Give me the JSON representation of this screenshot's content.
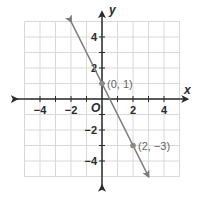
{
  "chart_data": {
    "type": "line",
    "title": "",
    "xlabel": "x",
    "ylabel": "y",
    "origin_label": "O",
    "xlim": [
      -5,
      5
    ],
    "ylim": [
      -5,
      5
    ],
    "grid": true,
    "x_tick_labels": [
      "−4",
      "−2",
      "2",
      "4"
    ],
    "x_tick_values": [
      -4,
      -2,
      2,
      4
    ],
    "y_tick_labels": [
      "4",
      "2",
      "−2",
      "−4"
    ],
    "y_tick_values": [
      4,
      2,
      -2,
      -4
    ],
    "series": [
      {
        "name": "line",
        "equation": "y = -2x + 1",
        "x": [
          -2,
          3
        ],
        "y": [
          5,
          -5
        ],
        "arrows": "both"
      }
    ],
    "points": [
      {
        "x": 0,
        "y": 1,
        "label": "(0, 1)"
      },
      {
        "x": 2,
        "y": -3,
        "label": "(2, −3)"
      }
    ],
    "colors": {
      "grid": "#d9d9d9",
      "axes": "#2a2a2a",
      "line": "#7a7a7a",
      "point": "#8a8a8a"
    }
  }
}
